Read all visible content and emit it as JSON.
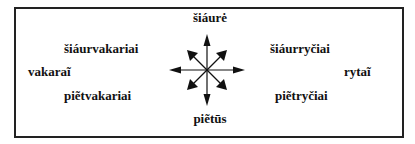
{
  "diagram": {
    "type": "compass-rose",
    "labels": {
      "north": "šiáurė",
      "northwest": "šiáurvakariai",
      "west": "vakaraĩ",
      "southwest": "piẽtvakariai",
      "south": "piẽtūs",
      "northeast": "šiáurryčiai",
      "east": "rytaĩ",
      "southeast": "piẽtryčiai"
    },
    "colors": {
      "border": "#222222",
      "arrows": "#111111",
      "text": "#111111"
    }
  }
}
